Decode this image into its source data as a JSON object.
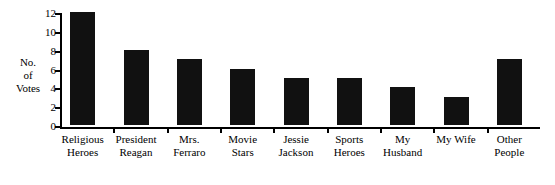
{
  "chart_data": {
    "type": "bar",
    "title": "",
    "xlabel": "",
    "ylabel": "No. of Votes",
    "ylim": [
      0,
      12
    ],
    "ytick_labels": [
      "12",
      "10",
      "8",
      "6",
      "4",
      "2",
      "0"
    ],
    "ytick_values": [
      12,
      10,
      8,
      6,
      4,
      2,
      0
    ],
    "grid": false,
    "legend": false,
    "categories": [
      "Religious Heroes",
      "President Reagan",
      "Mrs. Ferraro",
      "Movie Stars",
      "Jessie Jackson",
      "Sports Heroes",
      "My Husband",
      "My Wife",
      "Other People"
    ],
    "values": [
      12,
      8,
      7,
      6,
      5,
      5,
      4,
      3,
      7
    ],
    "bar_color": "#111111",
    "axis_color": "#000000",
    "background_color": "#ffffff"
  },
  "axis": {
    "y_title_lines": [
      "No.",
      "of",
      "Votes"
    ]
  },
  "x_labels": [
    {
      "line1": "Religious",
      "line2": "Heroes"
    },
    {
      "line1": "President",
      "line2": "Reagan"
    },
    {
      "line1": "Mrs.",
      "line2": "Ferraro"
    },
    {
      "line1": "Movie",
      "line2": "Stars"
    },
    {
      "line1": "Jessie",
      "line2": "Jackson"
    },
    {
      "line1": "Sports",
      "line2": "Heroes"
    },
    {
      "line1": "My",
      "line2": "Husband"
    },
    {
      "line1": "My Wife",
      "line2": ""
    },
    {
      "line1": "Other",
      "line2": "People"
    }
  ]
}
